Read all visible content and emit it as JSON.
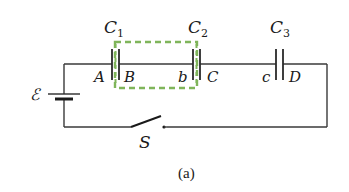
{
  "diagram": {
    "type": "circuit",
    "caption": "(a)",
    "source": {
      "label": "ℰ",
      "symbol": "battery"
    },
    "switch": {
      "label": "S",
      "state": "open"
    },
    "capacitors": [
      {
        "name": "C",
        "sub": "1",
        "left_node": "A",
        "right_node": "B"
      },
      {
        "name": "C",
        "sub": "2",
        "left_node": "b",
        "right_node": "C"
      },
      {
        "name": "C",
        "sub": "3",
        "left_node": "c",
        "right_node": "D"
      }
    ],
    "highlight_box": {
      "style": "dashed",
      "color": "#7fb55a",
      "encloses": [
        "B",
        "b"
      ]
    }
  }
}
